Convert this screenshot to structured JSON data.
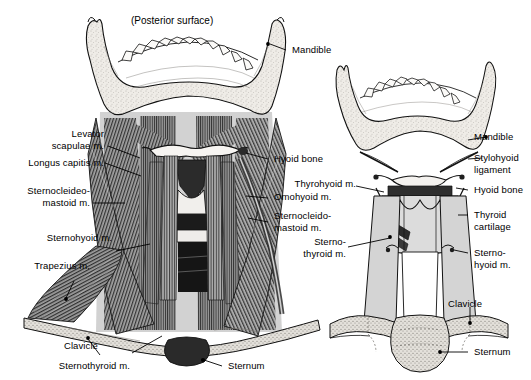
{
  "figure": {
    "caption": "(Posterior surface)",
    "background": "#ffffff",
    "ink": "#000000",
    "bone_fill": "#eceae6",
    "cartilage_fill": "#d9d9d9",
    "muscle_fill": "#8d8d8d",
    "shadow_fill": "#1a1a1a"
  },
  "left_panel": {
    "name": "posterior-neck-dissection",
    "labels_left": [
      {
        "id": "levator-scapulae",
        "text": "Levator\nscapulae m."
      },
      {
        "id": "longus-capitis",
        "text": "Longus capitis m."
      },
      {
        "id": "sternocleidomastoid-left",
        "text": "Sternocleideo-\nmastoid m."
      },
      {
        "id": "sternohyoid-left",
        "text": "Sternohyoid m."
      },
      {
        "id": "trapezius",
        "text": "Trapezius m."
      },
      {
        "id": "clavicle-left",
        "text": "Clavicle"
      },
      {
        "id": "sternothyroid-left",
        "text": "Sternothyroid m."
      }
    ],
    "labels_right": [
      {
        "id": "mandible-left",
        "text": "Mandible"
      },
      {
        "id": "hyoid-bone-left",
        "text": "Hyoid bone"
      },
      {
        "id": "omohyoid",
        "text": "Omohyoid m."
      },
      {
        "id": "sternocleidomastoid-right",
        "text": "Sternocleido-\nmastoid m."
      },
      {
        "id": "sternum-left",
        "text": "Sternum"
      }
    ]
  },
  "right_panel": {
    "name": "anterior-larynx-diagram",
    "labels_left": [
      {
        "id": "thyrohyoid",
        "text": "Thyrohyoid m."
      },
      {
        "id": "sternothyroid-right",
        "text": "Sterno-\nthyroid m."
      }
    ],
    "labels_right": [
      {
        "id": "mandible-right",
        "text": "Mandible"
      },
      {
        "id": "stylohyoid-ligament",
        "text": "Stylohyoid\nligament"
      },
      {
        "id": "hyoid-bone-right",
        "text": "Hyoid bone"
      },
      {
        "id": "thyroid-cartilage",
        "text": "Thyroid\ncartilage"
      },
      {
        "id": "sternohyoid-right",
        "text": "Sterno-\nhyoid m."
      },
      {
        "id": "clavicle-right",
        "text": "Clavicle"
      },
      {
        "id": "sternum-right",
        "text": "Sternum"
      }
    ]
  }
}
